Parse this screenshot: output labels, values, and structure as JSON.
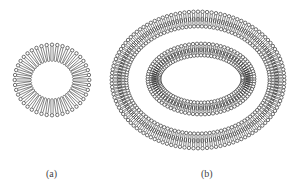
{
  "figure": {
    "type": "lipid-vesicle-diagram",
    "stroke_color": "#333333",
    "background": "#ffffff",
    "panels": [
      {
        "id": "a",
        "label": "(a)",
        "description": "single closed lipid layer (small vesicle)",
        "rings": [
          {
            "cx": 52,
            "cy": 80,
            "rx": 39,
            "ry": 37,
            "thickness": 17,
            "kind": "monolayer",
            "count": 44
          }
        ]
      },
      {
        "id": "b",
        "label": "(b)",
        "description": "multilamellar vesicle with two concentric bilayers",
        "rings": [
          {
            "cx": 198,
            "cy": 80,
            "rx": 88,
            "ry": 70,
            "thickness": 18,
            "kind": "bilayer",
            "count": 120
          },
          {
            "cx": 201,
            "cy": 79,
            "rx": 55,
            "ry": 37,
            "thickness": 15,
            "kind": "bilayer",
            "count": 84
          }
        ]
      }
    ]
  }
}
